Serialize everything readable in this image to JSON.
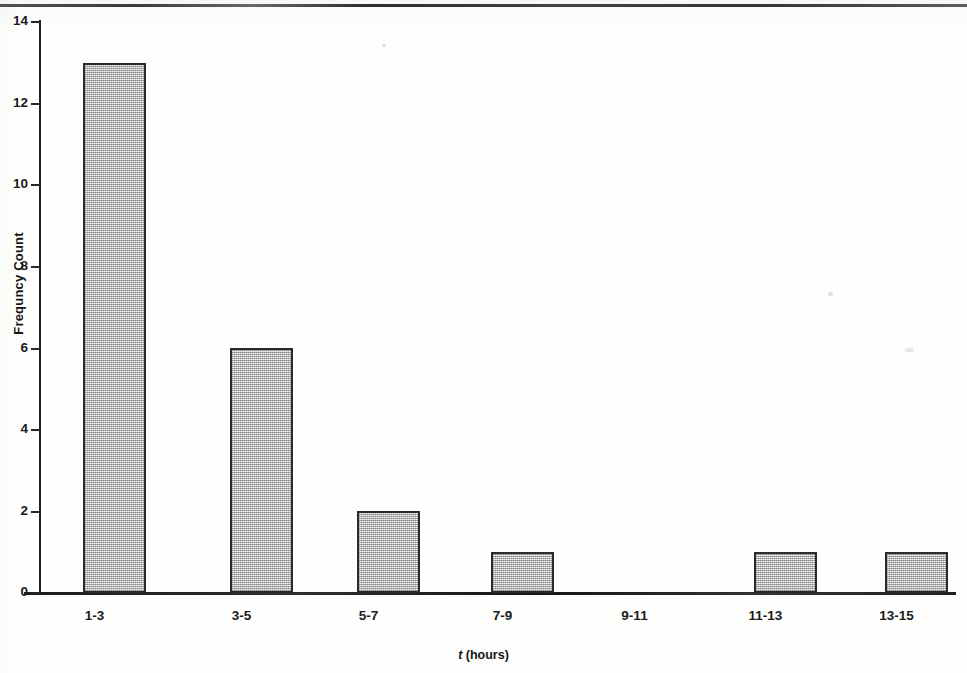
{
  "chart_data": {
    "type": "bar",
    "title": "",
    "categories": [
      "1-3",
      "3-5",
      "5-7",
      "7-9",
      "9-11",
      "11-13",
      "13-15"
    ],
    "values": [
      13,
      6,
      2,
      1,
      0,
      1,
      1
    ],
    "xlabel_variable": "t",
    "xlabel_units": "(hours)",
    "xlabel": "t (hours)",
    "ylabel": "Frequncy Count",
    "ylim": [
      0,
      14
    ],
    "ytick_values": [
      14,
      12,
      10,
      8,
      6,
      4,
      2,
      0
    ],
    "ytick_labels": [
      "14",
      "12",
      "10",
      "8",
      "6",
      "4",
      "2",
      "0"
    ],
    "grid": false,
    "legend": false,
    "bar_fill_color": "#cfcfcf",
    "bar_edge_color": "#2a2a2a",
    "background_color": "#fefefd",
    "axis_color": "#1b1b1b"
  },
  "figure": {
    "title_remnant": "",
    "page_rule": ""
  }
}
